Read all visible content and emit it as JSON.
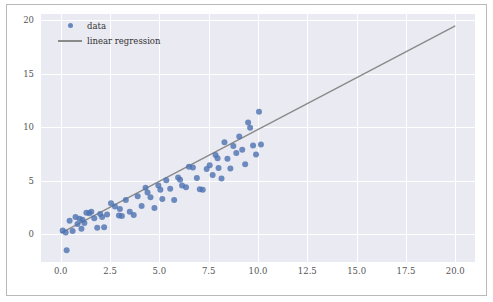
{
  "chart_data": {
    "type": "scatter",
    "title": "",
    "xlabel": "",
    "ylabel": "",
    "xlim": [
      -1.0,
      21.0
    ],
    "ylim": [
      -2.6,
      20.6
    ],
    "grid": true,
    "legend_position": "upper-left",
    "xticks": [
      "0.0",
      "2.5",
      "5.0",
      "7.5",
      "10.0",
      "12.5",
      "15.0",
      "17.5",
      "20.0"
    ],
    "xtick_values": [
      0.0,
      2.5,
      5.0,
      7.5,
      10.0,
      12.5,
      15.0,
      17.5,
      20.0
    ],
    "yticks": [
      "0",
      "5",
      "10",
      "15",
      "20"
    ],
    "ytick_values": [
      0,
      5,
      10,
      15,
      20
    ],
    "series": [
      {
        "name": "data",
        "type": "scatter",
        "color": "#4c72b0",
        "marker": "circle",
        "points": [
          [
            0.3,
            -1.5
          ],
          [
            0.1,
            0.35
          ],
          [
            0.25,
            0.15
          ],
          [
            0.45,
            1.25
          ],
          [
            0.6,
            0.3
          ],
          [
            0.75,
            1.6
          ],
          [
            0.95,
            1.45
          ],
          [
            1.05,
            0.5
          ],
          [
            1.2,
            1.05
          ],
          [
            1.3,
            2.0
          ],
          [
            1.45,
            1.95
          ],
          [
            1.55,
            2.1
          ],
          [
            1.7,
            1.5
          ],
          [
            1.85,
            0.6
          ],
          [
            2.0,
            1.9
          ],
          [
            2.2,
            0.65
          ],
          [
            2.35,
            1.85
          ],
          [
            2.55,
            2.9
          ],
          [
            2.75,
            2.6
          ],
          [
            2.95,
            1.75
          ],
          [
            3.1,
            1.7
          ],
          [
            3.3,
            3.2
          ],
          [
            3.5,
            2.1
          ],
          [
            3.7,
            1.8
          ],
          [
            3.9,
            3.55
          ],
          [
            4.1,
            2.65
          ],
          [
            4.3,
            4.35
          ],
          [
            4.55,
            3.45
          ],
          [
            4.75,
            2.45
          ],
          [
            4.95,
            4.55
          ],
          [
            5.15,
            3.3
          ],
          [
            5.35,
            5.05
          ],
          [
            5.55,
            4.25
          ],
          [
            5.75,
            3.2
          ],
          [
            5.95,
            5.3
          ],
          [
            6.15,
            4.55
          ],
          [
            6.35,
            4.4
          ],
          [
            6.5,
            6.3
          ],
          [
            6.7,
            6.25
          ],
          [
            6.9,
            5.25
          ],
          [
            7.05,
            4.2
          ],
          [
            7.2,
            4.15
          ],
          [
            7.4,
            6.1
          ],
          [
            7.55,
            6.45
          ],
          [
            7.7,
            5.55
          ],
          [
            7.85,
            7.4
          ],
          [
            8.0,
            6.2
          ],
          [
            8.15,
            5.2
          ],
          [
            8.3,
            8.6
          ],
          [
            8.45,
            7.05
          ],
          [
            8.6,
            6.15
          ],
          [
            8.75,
            8.25
          ],
          [
            8.9,
            7.6
          ],
          [
            9.05,
            9.15
          ],
          [
            9.2,
            7.9
          ],
          [
            9.35,
            6.55
          ],
          [
            9.5,
            10.45
          ],
          [
            9.6,
            9.95
          ],
          [
            9.75,
            8.3
          ],
          [
            9.9,
            7.45
          ],
          [
            10.05,
            11.45
          ],
          [
            10.15,
            8.4
          ],
          [
            4.4,
            3.9
          ],
          [
            5.05,
            4.15
          ],
          [
            6.05,
            5.1
          ],
          [
            7.95,
            7.1
          ],
          [
            2.1,
            1.6
          ],
          [
            3.0,
            2.35
          ],
          [
            1.1,
            1.35
          ],
          [
            0.85,
            0.95
          ]
        ]
      },
      {
        "name": "linear regression",
        "type": "line",
        "color": "#8a8a8a",
        "line_start": [
          0.0,
          0.1
        ],
        "line_end": [
          20.0,
          19.5
        ],
        "slope": 0.97,
        "intercept": 0.1
      }
    ]
  },
  "legend": {
    "items": [
      {
        "label": "data",
        "marker": "dot"
      },
      {
        "label": "linear regression",
        "marker": "line"
      }
    ]
  },
  "colors": {
    "plot_background": "#eaeaf2",
    "figure_background": "#ffffff",
    "grid": "#ffffff",
    "scatter": "#4c72b0",
    "regression_line": "#8a8a8a",
    "tick_text": "#555555",
    "frame_border": "#b9b9b9"
  }
}
